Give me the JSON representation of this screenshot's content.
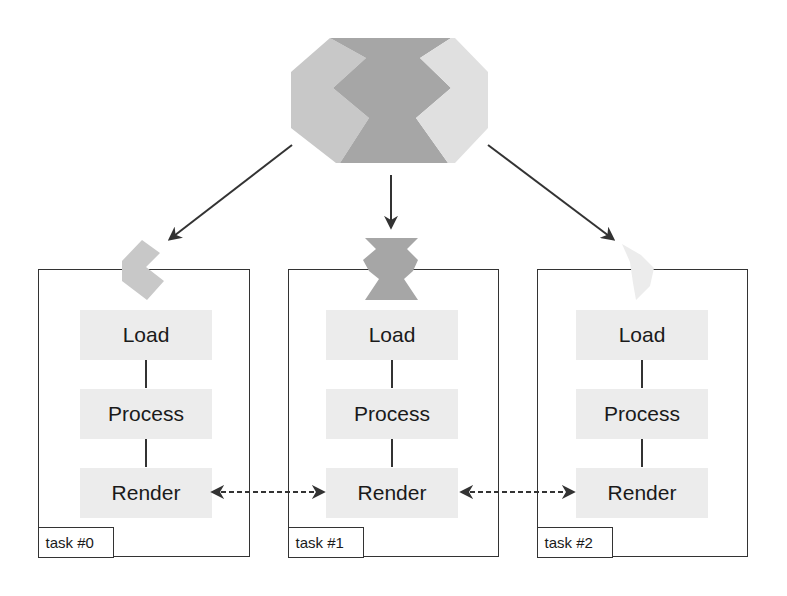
{
  "diagram": {
    "colors": {
      "piece_left": "#c8c8c8",
      "piece_center": "#a6a6a6",
      "piece_right": "#e0e0e0",
      "piece_right_small": "#ececec",
      "step_fill": "#ececec",
      "stroke": "#333333"
    },
    "source_shape": {
      "name": "partitioned-data-shape",
      "pieces": [
        "left",
        "center",
        "right"
      ]
    },
    "tasks": [
      {
        "label": "task #0",
        "piece": "left",
        "steps": [
          {
            "label": "Load"
          },
          {
            "label": "Process"
          },
          {
            "label": "Render"
          }
        ]
      },
      {
        "label": "task #1",
        "piece": "center",
        "steps": [
          {
            "label": "Load"
          },
          {
            "label": "Process"
          },
          {
            "label": "Render"
          }
        ]
      },
      {
        "label": "task #2",
        "piece": "right",
        "steps": [
          {
            "label": "Load"
          },
          {
            "label": "Process"
          },
          {
            "label": "Render"
          }
        ]
      }
    ],
    "connections": [
      {
        "from": "source",
        "to": "task #0",
        "style": "solid-arrow"
      },
      {
        "from": "source",
        "to": "task #1",
        "style": "solid-arrow"
      },
      {
        "from": "source",
        "to": "task #2",
        "style": "solid-arrow"
      },
      {
        "from": "task #0 Render",
        "to": "task #1 Render",
        "style": "dashed-double-arrow"
      },
      {
        "from": "task #1 Render",
        "to": "task #2 Render",
        "style": "dashed-double-arrow"
      }
    ]
  }
}
